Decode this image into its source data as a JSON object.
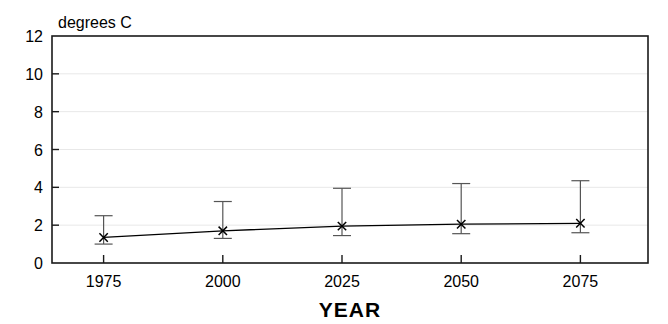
{
  "chart_data": {
    "type": "line",
    "title": "",
    "subtitle": "",
    "xlabel": "YEAR",
    "ylabel": "degrees C",
    "ylabel_position": "top-left-above-axis",
    "categories": [
      "1975",
      "2000",
      "2025",
      "2050",
      "2075"
    ],
    "x": [
      1975,
      2000,
      2025,
      2050,
      2075
    ],
    "values": [
      1.35,
      1.7,
      1.95,
      2.05,
      2.1
    ],
    "error_low": [
      1.0,
      1.3,
      1.45,
      1.55,
      1.6
    ],
    "error_high": [
      2.5,
      3.25,
      3.95,
      4.2,
      4.35
    ],
    "series": [
      {
        "name": "degrees C",
        "values": [
          1.35,
          1.7,
          1.95,
          2.05,
          2.1
        ],
        "error_low": [
          1.0,
          1.3,
          1.45,
          1.55,
          1.6
        ],
        "error_high": [
          2.5,
          3.25,
          3.95,
          4.2,
          4.35
        ],
        "marker": "x",
        "color": "#000000"
      }
    ],
    "ylim": [
      0,
      12
    ],
    "yticks": [
      0,
      2,
      4,
      6,
      8,
      10,
      12
    ],
    "ytick_labels": [
      "0",
      "2",
      "4",
      "6",
      "8",
      "10",
      "12"
    ],
    "xticks": [
      1975,
      2000,
      2025,
      2050,
      2075
    ],
    "xtick_labels": [
      "1975",
      "2000",
      "2025",
      "2050",
      "2075"
    ],
    "grid": true,
    "grid_axis": "y",
    "grid_color": "#e8e8e8",
    "legend": false,
    "legend_position": "none",
    "frame": true,
    "frame_color": "#1a1a1a",
    "background": "#ffffff",
    "line_color": "#000000",
    "errorbar_color": "#555555"
  }
}
